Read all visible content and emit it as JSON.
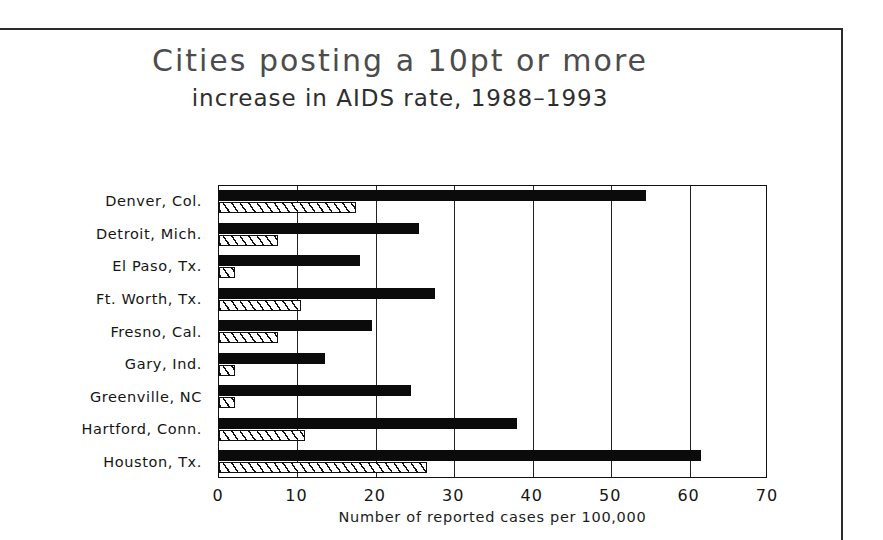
{
  "figure": {
    "title": "Cities posting a 10pt or more",
    "subtitle": "increase in AIDS rate, 1988–1993"
  },
  "chart_data": {
    "type": "bar",
    "orientation": "horizontal",
    "xlabel": "Number of reported cases per 100,000",
    "ylabel": "",
    "xlim": [
      0,
      70
    ],
    "xticks": [
      0,
      10,
      20,
      30,
      40,
      50,
      60,
      70
    ],
    "xtick_labels": [
      "0",
      "10",
      "20",
      "30",
      "40",
      "50",
      "60",
      "70"
    ],
    "grid": "vertical",
    "legend": "none",
    "categories": [
      "Denver, Col.",
      "Detroit, Mich.",
      "El Paso, Tx.",
      "Ft. Worth, Tx.",
      "Fresno, Cal.",
      "Gary, Ind.",
      "Greenville, NC",
      "Hartford, Conn.",
      "Houston, Tx."
    ],
    "series": [
      {
        "name": "1993",
        "style": "solid-black",
        "color": "#0b0b0b",
        "values": [
          54.5,
          25.5,
          18.0,
          27.5,
          19.5,
          13.5,
          24.5,
          38.0,
          61.5
        ]
      },
      {
        "name": "1988",
        "style": "hatched",
        "color": "#ffffff",
        "values": [
          17.5,
          7.5,
          2.0,
          10.5,
          7.5,
          2.0,
          2.0,
          11.0,
          26.5
        ]
      }
    ]
  }
}
